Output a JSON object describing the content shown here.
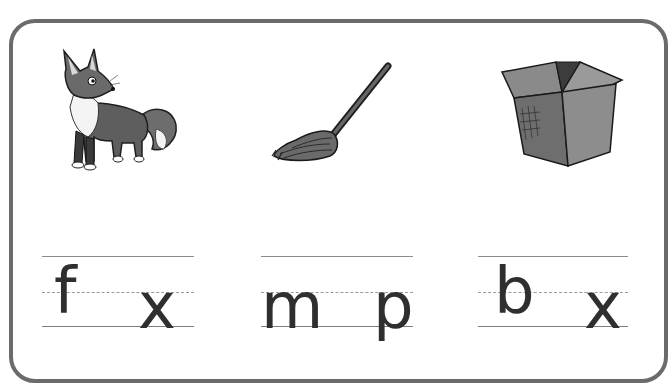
{
  "worksheet": {
    "title": "",
    "colors": {
      "frame": "#6b6b6b",
      "guide_lines": "#8c8c8c",
      "letters": "#2f2f2f"
    },
    "items": [
      {
        "picture": "fox-icon",
        "word": "fox",
        "first_letter": "f",
        "blank": "",
        "last_letter": "x"
      },
      {
        "picture": "mop-icon",
        "word": "mop",
        "first_letter": "m",
        "blank": "",
        "last_letter": "p"
      },
      {
        "picture": "box-icon",
        "word": "box",
        "first_letter": "b",
        "blank": "",
        "last_letter": "x"
      }
    ]
  }
}
